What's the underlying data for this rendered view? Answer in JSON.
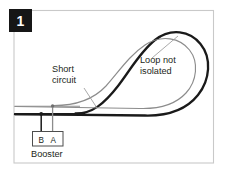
{
  "figure": {
    "badge": {
      "number": "1"
    },
    "labels": {
      "short_circuit_line1": "Short",
      "short_circuit_line2": "circuit",
      "loop_not_isolated_line1": "Loop not",
      "loop_not_isolated_line2": "isolated",
      "booster": "Booster",
      "terminal_b": "B",
      "terminal_a": "A"
    },
    "colors": {
      "rail_black": "#1a1a1a",
      "rail_gray": "#8c8c8c",
      "frame_border": "#c8c8c8",
      "badge_background": "#161616",
      "badge_text": "#ffffff",
      "text": "#231f20",
      "background": "#ffffff"
    }
  }
}
